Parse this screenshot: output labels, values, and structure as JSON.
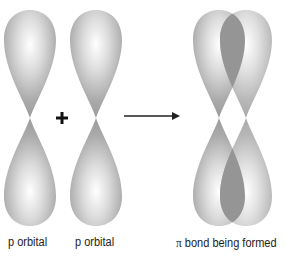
{
  "diagram": {
    "operator_plus": "+",
    "arrow": "reaction-arrow",
    "labels": {
      "orbital_1": "p orbital",
      "orbital_2": "p orbital",
      "pi_symbol": "π",
      "result": "bond being formed"
    },
    "colors": {
      "lobe_edge": "#9a9a9a",
      "lobe_highlight": "#ffffff",
      "overlap": "#8f8f8f",
      "text": "#222222",
      "background": "#ffffff"
    }
  }
}
